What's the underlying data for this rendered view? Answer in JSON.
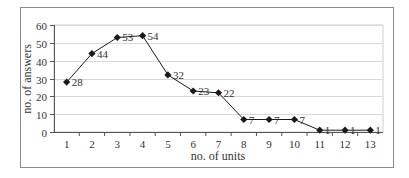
{
  "chart_data": {
    "type": "line",
    "title": "",
    "xlabel": "no. of units",
    "ylabel": "no. of answers",
    "categories": [
      "1",
      "2",
      "3",
      "4",
      "5",
      "6",
      "7",
      "8",
      "9",
      "10",
      "11",
      "12",
      "13"
    ],
    "series": [
      {
        "name": "no. of answers",
        "values": [
          28,
          44,
          53,
          54,
          32,
          23,
          22,
          7,
          7,
          7,
          1,
          1,
          1
        ],
        "marker": "diamond",
        "color": "#1a1a1a"
      }
    ],
    "ylim": [
      0,
      60
    ],
    "yticks": [
      0,
      10,
      20,
      30,
      40,
      50,
      60
    ],
    "grid": true,
    "legend": false,
    "data_labels": [
      "28",
      "44",
      "53",
      "54",
      "32",
      "23",
      "22",
      "7",
      "7",
      "7",
      "1",
      "1",
      "1"
    ]
  }
}
